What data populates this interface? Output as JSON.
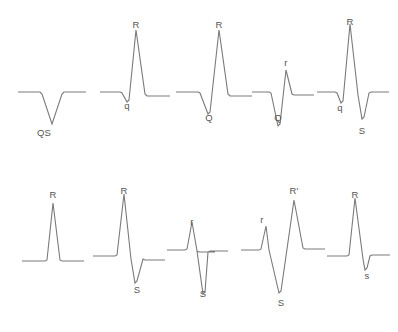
{
  "figure": {
    "background_color": "#ffffff",
    "trace_color": "#7a7a7a",
    "label_color": "#555555",
    "rows": 2,
    "columns": 5,
    "complexes": [
      {
        "id": "qs",
        "name": "QS complex",
        "row": 1,
        "column": 1,
        "origin_x": 18,
        "origin_y": 92,
        "baseline_y": 92,
        "points": "0,0 22,0 24,2 34,32 44,2 46,0 68,0",
        "labels": [
          {
            "text": "QS",
            "x": 44,
            "y": 128,
            "name": "label-qs"
          }
        ]
      },
      {
        "id": "qr",
        "name": "qR complex",
        "row": 1,
        "column": 2,
        "origin_x": 100,
        "origin_y": 92,
        "baseline_y": 92,
        "points": "0,0 20,0 22,1 27,10 29,8 36,-62 45,2 47,4 49,4 70,4",
        "labels": [
          {
            "text": "R",
            "x": 136,
            "y": 20,
            "name": "label-r"
          },
          {
            "text": "q",
            "x": 127,
            "y": 101,
            "name": "label-q"
          }
        ]
      },
      {
        "id": "QR",
        "name": "QR complex",
        "row": 1,
        "column": 3,
        "origin_x": 176,
        "origin_y": 92,
        "baseline_y": 92,
        "points": "0,0 22,0 24,1 32,22 34,20 43,-62 52,2 54,4 56,4 76,4",
        "labels": [
          {
            "text": "R",
            "x": 219,
            "y": 20,
            "name": "label-r"
          },
          {
            "text": "Q",
            "x": 209,
            "y": 113,
            "name": "label-q"
          }
        ]
      },
      {
        "id": "Qr",
        "name": "Qr complex",
        "row": 1,
        "column": 4,
        "origin_x": 252,
        "origin_y": 92,
        "baseline_y": 92,
        "points": "0,0 17,0 19,1 26,34 28,32 34,-22 40,2 42,3 44,3 62,3",
        "labels": [
          {
            "text": "r",
            "x": 286,
            "y": 58,
            "name": "label-r"
          },
          {
            "text": "Q",
            "x": 278,
            "y": 113,
            "name": "label-q"
          }
        ]
      },
      {
        "id": "qRS",
        "name": "qRS complex",
        "row": 1,
        "column": 5,
        "origin_x": 317,
        "origin_y": 92,
        "baseline_y": 92,
        "points": "0,0 18,0 20,1 24,11 26,9 33,-68 41,3 45,27 47,25 52,1 54,0 72,0",
        "labels": [
          {
            "text": "R",
            "x": 350,
            "y": 17,
            "name": "label-r"
          },
          {
            "text": "q",
            "x": 340,
            "y": 103,
            "name": "label-q"
          },
          {
            "text": "S",
            "x": 362,
            "y": 126,
            "name": "label-s"
          }
        ]
      },
      {
        "id": "R",
        "name": "R complex",
        "row": 2,
        "column": 1,
        "origin_x": 22,
        "origin_y": 261,
        "baseline_y": 261,
        "points": "0,0 23,0 25,-1 31,-58 38,-1 40,0 62,0",
        "labels": [
          {
            "text": "R",
            "x": 53,
            "y": 190,
            "name": "label-r"
          }
        ]
      },
      {
        "id": "RS",
        "name": "RS complex",
        "row": 2,
        "column": 2,
        "origin_x": 93,
        "origin_y": 256,
        "baseline_y": 256,
        "points": "0,0 22,0 24,-1 31,-62 38,3 42,27 44,25 50,3 52,4 54,4 72,4",
        "labels": [
          {
            "text": "R",
            "x": 124,
            "y": 186,
            "name": "label-r"
          },
          {
            "text": "S",
            "x": 137,
            "y": 285,
            "name": "label-s"
          }
        ]
      },
      {
        "id": "rS",
        "name": "rS complex",
        "row": 2,
        "column": 3,
        "origin_x": 167,
        "origin_y": 250,
        "baseline_y": 250,
        "points": "0,0 18,0 20,-1 25,-28 30,1 32,2 48,2 32,2 30,1 36,44 38,42 41,2 43,1 45,1 61,1",
        "labels": [
          {
            "text": "r",
            "x": 192,
            "y": 217,
            "name": "label-r"
          },
          {
            "text": "S",
            "x": 203,
            "y": 289,
            "name": "label-s"
          }
        ]
      },
      {
        "id": "rSR",
        "name": "rSR' complex",
        "row": 2,
        "column": 4,
        "origin_x": 241,
        "origin_y": 250,
        "baseline_y": 250,
        "points": "0,0 18,0 20,-1 25,-24 28,0 38,43 40,41 53,-50 62,-2 64,-1 66,-1 84,-1",
        "labels": [
          {
            "text": "R'",
            "x": 294,
            "y": 186,
            "name": "label-r-prime"
          },
          {
            "text": "r",
            "x": 262,
            "y": 215,
            "name": "label-r"
          },
          {
            "text": "S",
            "x": 281,
            "y": 298,
            "name": "label-s"
          }
        ]
      },
      {
        "id": "Rs",
        "name": "Rs complex",
        "row": 2,
        "column": 5,
        "origin_x": 327,
        "origin_y": 256,
        "baseline_y": 256,
        "points": "0,0 20,0 22,-1 28,-58 36,3 38,14 40,12 43,0 45,-1 47,-1 63,-1",
        "labels": [
          {
            "text": "R",
            "x": 355,
            "y": 190,
            "name": "label-r"
          },
          {
            "text": "s",
            "x": 367,
            "y": 271,
            "name": "label-s"
          }
        ]
      }
    ]
  }
}
